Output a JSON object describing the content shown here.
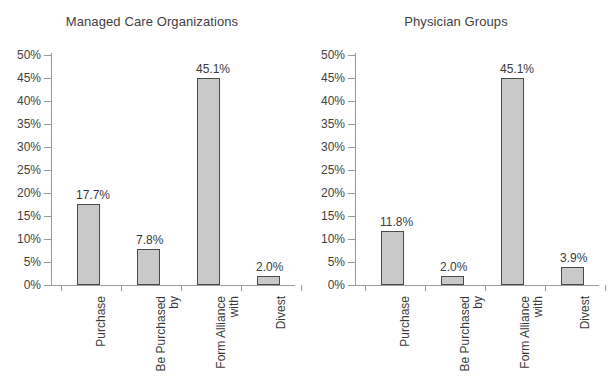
{
  "figure": {
    "background": "#ffffff",
    "bar_fill": "#c9c9c9",
    "bar_border": "#4a4a4a",
    "axis_color": "#9a9a9a",
    "text_color": "#3a3a3a"
  },
  "charts": [
    {
      "title": "Managed Care Organizations",
      "yticks": [
        "50%",
        "45%",
        "40%",
        "35%",
        "30%",
        "25%",
        "20%",
        "15%",
        "10%",
        "5%",
        "0%"
      ],
      "categories": [
        "Purchase",
        "Be Purchased\nby",
        "Form Alliance\nwith",
        "Divest"
      ],
      "values": [
        17.7,
        7.8,
        45.1,
        2.0
      ],
      "labels": [
        "17.7%",
        "7.8%",
        "45.1%",
        "2.0%"
      ]
    },
    {
      "title": "Physician Groups",
      "yticks": [
        "50%",
        "45%",
        "40%",
        "35%",
        "30%",
        "25%",
        "20%",
        "15%",
        "10%",
        "5%",
        "0%"
      ],
      "categories": [
        "Purchase",
        "Be Purchased\nby",
        "Form Alliance\nwith",
        "Divest"
      ],
      "values": [
        11.8,
        2.0,
        45.1,
        3.9
      ],
      "labels": [
        "11.8%",
        "2.0%",
        "45.1%",
        "3.9%"
      ]
    }
  ],
  "chart_data": {
    "type": "bar",
    "xlabel": "",
    "ylabel": "",
    "ylim": [
      0,
      50
    ],
    "ytick_values": [
      0,
      5,
      10,
      15,
      20,
      25,
      30,
      35,
      40,
      45,
      50
    ],
    "ytick_labels": [
      "0%",
      "5%",
      "10%",
      "15%",
      "20%",
      "25%",
      "30%",
      "35%",
      "40%",
      "45%",
      "50%"
    ],
    "grid": false,
    "legend": "none",
    "panels": [
      {
        "title": "Managed Care Organizations",
        "categories": [
          "Purchase",
          "Be Purchased by",
          "Form Alliance with",
          "Divest"
        ],
        "values": [
          17.7,
          7.8,
          45.1,
          2.0
        ],
        "data_labels": [
          "17.7%",
          "7.8%",
          "45.1%",
          "2.0%"
        ]
      },
      {
        "title": "Physician Groups",
        "categories": [
          "Purchase",
          "Be Purchased by",
          "Form Alliance with",
          "Divest"
        ],
        "values": [
          11.8,
          2.0,
          45.1,
          3.9
        ],
        "data_labels": [
          "11.8%",
          "2.0%",
          "45.1%",
          "3.9%"
        ]
      }
    ]
  }
}
